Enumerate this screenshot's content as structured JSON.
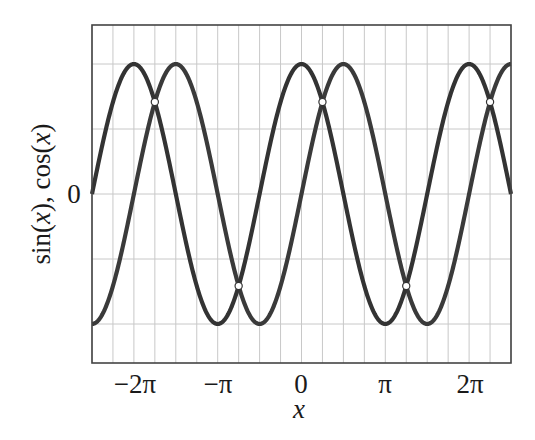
{
  "chart_data": {
    "type": "line",
    "title": "",
    "xlabel": "x",
    "ylabel": "sin(x), cos(x)",
    "xlim_pi": [
      -2.5,
      2.5
    ],
    "ylim": [
      -1.3,
      1.3
    ],
    "grid": true,
    "grid_x_step_pi": 0.25,
    "grid_y_step": 0.5,
    "x_ticks": [
      {
        "value_pi": -2,
        "label": "−2π"
      },
      {
        "value_pi": -1,
        "label": "−π"
      },
      {
        "value_pi": 0,
        "label": "0"
      },
      {
        "value_pi": 1,
        "label": "π"
      },
      {
        "value_pi": 2,
        "label": "2π"
      }
    ],
    "y_ticks": [
      {
        "value": 0,
        "label": "0"
      }
    ],
    "series": [
      {
        "name": "sin(x)",
        "function": "sin",
        "color": "#3a3a3a"
      },
      {
        "name": "cos(x)",
        "function": "cos",
        "color": "#333333"
      }
    ],
    "intersections": [
      {
        "x_pi": -1.75,
        "y": 0.7071
      },
      {
        "x_pi": -0.75,
        "y": -0.7071
      },
      {
        "x_pi": 0.25,
        "y": 0.7071
      },
      {
        "x_pi": 1.25,
        "y": -0.7071
      },
      {
        "x_pi": 2.25,
        "y": 0.7071
      }
    ],
    "legend": null
  },
  "labels": {
    "xlabel": "x",
    "ylabel_sin": "sin(",
    "ylabel_x1": "x",
    "ylabel_mid": "), cos(",
    "ylabel_x2": "x",
    "ylabel_end": ")",
    "y_zero": "0",
    "x_ticks": [
      "−2π",
      "−π",
      "0",
      "π",
      "2π"
    ]
  }
}
